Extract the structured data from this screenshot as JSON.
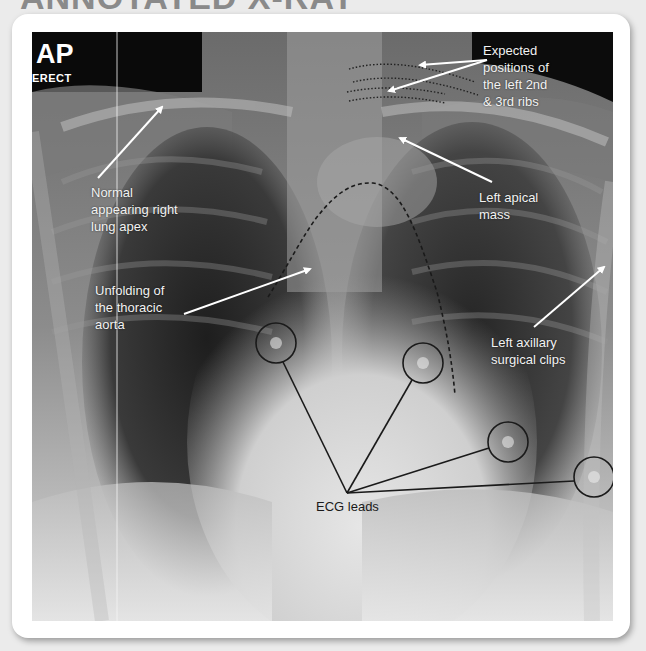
{
  "page": {
    "heading": "ANNOTATED X-RAY"
  },
  "xray": {
    "projection": "AP",
    "position": "ERECT"
  },
  "annotations": {
    "ribs": {
      "lines": [
        "Expected",
        "positions of",
        "the left 2nd",
        "& 3rd ribs"
      ]
    },
    "right_apex": {
      "lines": [
        "Normal",
        "appearing right",
        "lung apex"
      ]
    },
    "left_apical_mass": {
      "lines": [
        "Left apical",
        "mass"
      ]
    },
    "aorta": {
      "lines": [
        "Unfolding of",
        "the thoracic",
        "aorta"
      ]
    },
    "axillary_clips": {
      "lines": [
        "Left axillary",
        "surgical clips"
      ]
    },
    "ecg": {
      "label": "ECG leads",
      "lead_count": 4
    }
  },
  "colors": {
    "card_bg": "#ffffff",
    "page_bg": "#ebebeb",
    "annotation_text": "#f2f2f2",
    "arrow": "#ffffff",
    "ecg_line": "#1a1a1a",
    "dashed_outline": "#1a1a1a"
  }
}
